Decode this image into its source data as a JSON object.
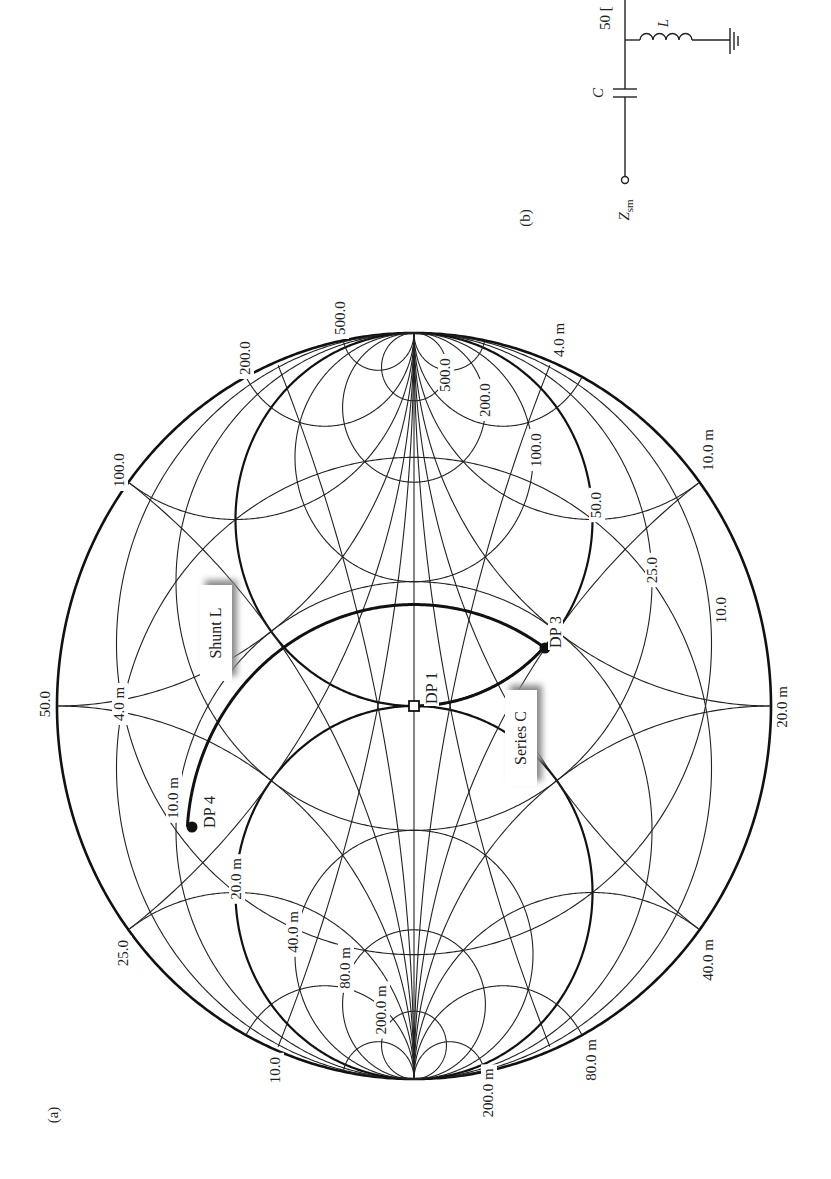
{
  "figure": {
    "panel_a_label": "(a)",
    "panel_b_label": "(b)"
  },
  "chart": {
    "type": "smith-chart-zy",
    "z0": 50,
    "orientation": "rotated-90: open-circuit at top, short-circuit at bottom",
    "geometry": {
      "cx": 414,
      "cy": 706,
      "rx": 357,
      "ry": 373
    },
    "resistance_circles_ohm": [
      10.0,
      25.0,
      50.0,
      100.0,
      200.0,
      500.0
    ],
    "conductance_circles_siemens": [
      0.004,
      0.01,
      0.02,
      0.04,
      0.08,
      0.2
    ],
    "reactance_arcs_ohm": [
      10.0,
      25.0,
      50.0,
      100.0,
      200.0,
      500.0
    ],
    "susceptance_arcs_siemens": [
      0.004,
      0.01,
      0.02,
      0.04,
      0.08,
      0.2
    ],
    "bold_circles": {
      "resistance_ohm": 50.0,
      "conductance_siemens": 0.02
    },
    "labels": [
      {
        "text": "500.0",
        "x": 345,
        "y": 318,
        "rot": -90
      },
      {
        "text": "200.0",
        "x": 250,
        "y": 358,
        "rot": -90
      },
      {
        "text": "100.0",
        "x": 124,
        "y": 470,
        "rot": -90
      },
      {
        "text": "50.0",
        "x": 50,
        "y": 704,
        "rot": -90
      },
      {
        "text": "25.0",
        "x": 128,
        "y": 953,
        "rot": -90
      },
      {
        "text": "10.0",
        "x": 280,
        "y": 1070,
        "rot": -90
      },
      {
        "text": "500.0",
        "x": 450,
        "y": 375,
        "rot": -90
      },
      {
        "text": "200.0",
        "x": 490,
        "y": 400,
        "rot": -90
      },
      {
        "text": "100.0",
        "x": 541,
        "y": 450,
        "rot": -90
      },
      {
        "text": "50.0",
        "x": 601,
        "y": 505,
        "rot": -90
      },
      {
        "text": "25.0",
        "x": 657,
        "y": 570,
        "rot": -90
      },
      {
        "text": "10.0",
        "x": 726,
        "y": 610,
        "rot": -90
      },
      {
        "text": "4.0 m",
        "x": 564,
        "y": 340,
        "rot": -90
      },
      {
        "text": "10.0 m",
        "x": 713,
        "y": 450,
        "rot": -90
      },
      {
        "text": "20.0 m",
        "x": 787,
        "y": 707,
        "rot": -90
      },
      {
        "text": "40.0 m",
        "x": 713,
        "y": 960,
        "rot": -90
      },
      {
        "text": "80.0 m",
        "x": 596,
        "y": 1060,
        "rot": -90
      },
      {
        "text": "200.0 m",
        "x": 493,
        "y": 1093,
        "rot": -90
      },
      {
        "text": "4.0 m",
        "x": 124,
        "y": 704,
        "rot": -90
      },
      {
        "text": "10.0 m",
        "x": 178,
        "y": 798,
        "rot": -90
      },
      {
        "text": "20.0 m",
        "x": 241,
        "y": 879,
        "rot": -90
      },
      {
        "text": "40.0 m",
        "x": 298,
        "y": 932,
        "rot": -90
      },
      {
        "text": "80.0 m",
        "x": 350,
        "y": 968,
        "rot": -90
      },
      {
        "text": "200.0 m",
        "x": 386,
        "y": 1010,
        "rot": -90
      }
    ],
    "design_points": [
      {
        "id": "DP1",
        "label": "DP 1",
        "marker": "open-square",
        "x": 414,
        "y": 706,
        "lx": 432,
        "ly": 688
      },
      {
        "id": "DP3",
        "label": "DP 3",
        "marker": "filled-circle",
        "x": 545,
        "y": 648,
        "lx": 556,
        "ly": 632
      },
      {
        "id": "DP4",
        "label": "DP 4",
        "marker": "filled-circle",
        "x": 192,
        "y": 827,
        "lx": 210,
        "ly": 812
      }
    ],
    "callouts": [
      {
        "id": "shunt-l",
        "text": "Shunt L",
        "x": 200,
        "y": 585,
        "w": 32,
        "h": 96
      },
      {
        "id": "series-c",
        "text": "Series C",
        "x": 505,
        "y": 690,
        "w": 32,
        "h": 96
      }
    ]
  },
  "circuit": {
    "source_label": "Z",
    "source_subscript": "sm",
    "capacitor_label": "C",
    "inductor_label": "L",
    "load_label": "50 ["
  }
}
